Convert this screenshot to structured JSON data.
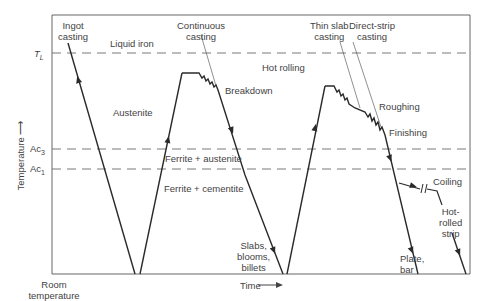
{
  "diagram": {
    "axis": {
      "y_label": "Temperature ⟶",
      "x_label": "Time ⟶",
      "origin_label": "Room temperature",
      "levels": [
        {
          "id": "TL",
          "label": "T",
          "sub": "L"
        },
        {
          "id": "Ac3",
          "label": "Ac",
          "sub": "3"
        },
        {
          "id": "Ac1",
          "label": "Ac",
          "sub": "1"
        }
      ]
    },
    "regions": {
      "liquid": "Liquid iron",
      "austenite": "Austenite",
      "ferrite_austenite": "Ferrite + austenite",
      "ferrite_cementite": "Ferrite + cementite",
      "hot_rolling": "Hot rolling"
    },
    "processes": {
      "ingot": [
        "Ingot",
        "casting"
      ],
      "continuous": [
        "Continuous",
        "casting"
      ],
      "thin_slab": [
        "Thin slab",
        "casting"
      ],
      "direct_strip": [
        "Direct-strip",
        "casting"
      ],
      "breakdown": "Breakdown",
      "roughing": "Roughing",
      "finishing": "Finishing",
      "coiling": "Coiling"
    },
    "products": {
      "slabs": [
        "Slabs,",
        "blooms,",
        "billets"
      ],
      "plate": [
        "Plate,",
        "bar"
      ],
      "strip": [
        "Hot-",
        "rolled",
        "strip"
      ]
    },
    "colors": {
      "line": "#2a2a2a",
      "dash": "#6a6a6a",
      "text": "#3f3f3f"
    }
  }
}
